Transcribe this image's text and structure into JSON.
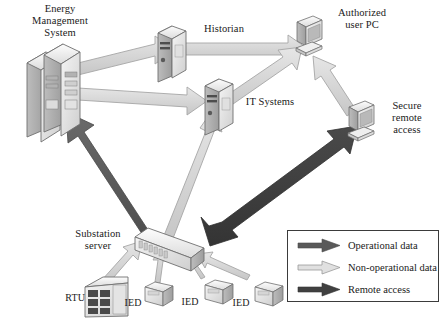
{
  "diagram": {
    "background_color": "#ffffff"
  },
  "nodes": [
    {
      "id": "ems",
      "label": "Energy\nManagement\nSystem",
      "icon": "server-tower-icon"
    },
    {
      "id": "historian",
      "label": "Historian",
      "icon": "server-icon"
    },
    {
      "id": "itsys",
      "label": "IT Systems",
      "icon": "server-icon"
    },
    {
      "id": "userpc",
      "label": "Authorized\nuser PC",
      "icon": "desktop-pc-icon"
    },
    {
      "id": "remote",
      "label": "Secure\nremote\naccess",
      "icon": "desktop-pc-icon"
    },
    {
      "id": "substation",
      "label": "Substation\nserver",
      "icon": "rack-switch-icon"
    },
    {
      "id": "rtu",
      "label": "RTU",
      "icon": "rtu-box-icon"
    },
    {
      "id": "ied1",
      "label": "IED",
      "icon": "ied-box-icon"
    },
    {
      "id": "ied2",
      "label": "IED",
      "icon": "ied-box-icon"
    },
    {
      "id": "ied3",
      "label": "IED",
      "icon": "ied-box-icon"
    }
  ],
  "legend": {
    "items": [
      {
        "label": "Operational data",
        "kind": "operational",
        "color": "#595959"
      },
      {
        "label": "Non-operational data",
        "kind": "non-operational",
        "color": "#d9d9d9"
      },
      {
        "label": "Remote access",
        "kind": "remote",
        "color": "#404040"
      }
    ]
  },
  "connections": [
    {
      "from": "ems",
      "to": "historian",
      "kind": "non-operational"
    },
    {
      "from": "ems",
      "to": "itsys",
      "kind": "non-operational"
    },
    {
      "from": "historian",
      "to": "userpc",
      "kind": "non-operational"
    },
    {
      "from": "itsys",
      "to": "userpc",
      "kind": "non-operational"
    },
    {
      "from": "remote",
      "to": "userpc",
      "kind": "non-operational"
    },
    {
      "from": "substation",
      "to": "itsys",
      "kind": "non-operational"
    },
    {
      "from": "substation",
      "to": "ems",
      "kind": "operational"
    },
    {
      "from": "substation",
      "to": "remote",
      "kind": "remote",
      "bidirectional": true
    },
    {
      "from": "rtu",
      "to": "substation",
      "kind": "non-operational"
    },
    {
      "from": "ied1",
      "to": "substation",
      "kind": "non-operational"
    },
    {
      "from": "ied2",
      "to": "substation",
      "kind": "non-operational"
    },
    {
      "from": "ied3",
      "to": "substation",
      "kind": "non-operational"
    }
  ],
  "colors": {
    "arrow_light_fill": "#d8d8d8",
    "arrow_light_stroke": "#9a9a9a",
    "arrow_dark_fill": "#595959",
    "arrow_remote_fill": "#404040",
    "device_fill": "#e8e8e8",
    "device_stroke": "#6f6f6f",
    "text": "#1a1a1a"
  }
}
